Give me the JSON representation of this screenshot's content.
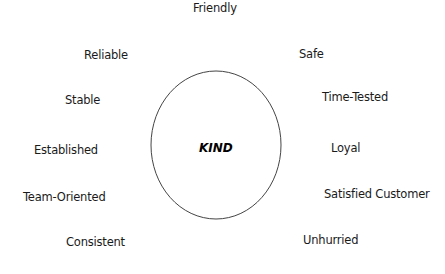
{
  "diagram": {
    "center": {
      "label": "KIND"
    },
    "attributes": [
      {
        "label": "Friendly",
        "x": 193,
        "y": 1
      },
      {
        "label": "Reliable",
        "x": 84,
        "y": 48
      },
      {
        "label": "Safe",
        "x": 299,
        "y": 47
      },
      {
        "label": "Stable",
        "x": 65,
        "y": 93
      },
      {
        "label": "Time-Tested",
        "x": 322,
        "y": 90
      },
      {
        "label": "Established",
        "x": 34,
        "y": 143
      },
      {
        "label": "Loyal",
        "x": 331,
        "y": 141
      },
      {
        "label": "Team-Oriented",
        "x": 23,
        "y": 190
      },
      {
        "label": "Satisfied Customer",
        "x": 324,
        "y": 187
      },
      {
        "label": "Consistent",
        "x": 66,
        "y": 235
      },
      {
        "label": "Unhurried",
        "x": 303,
        "y": 233
      }
    ],
    "ellipse": {
      "cx": 216,
      "cy": 145,
      "rx": 65,
      "ry": 74,
      "stroke": "#444444"
    }
  }
}
